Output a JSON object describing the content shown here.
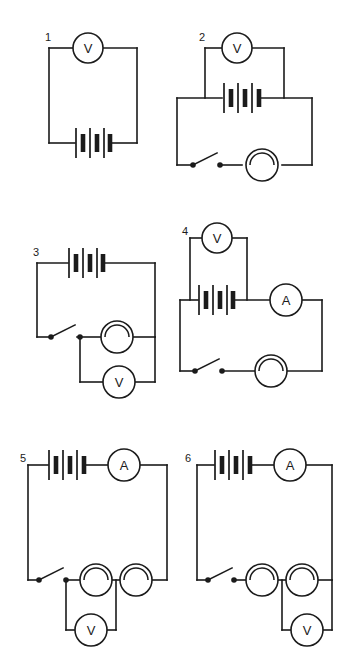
{
  "page": {
    "background_color": "#ffffff",
    "line_color": "#1b1b1b",
    "width": 344,
    "height": 654
  },
  "symbols": {
    "voltmeter_label": "V",
    "ammeter_label": "A",
    "battery_name": "battery-symbol",
    "lamp_name": "lamp-symbol",
    "switch_name": "switch-symbol"
  },
  "circuits": [
    {
      "number": "1",
      "components": [
        "voltmeter",
        "battery"
      ],
      "voltmeter_label": "V",
      "description": "Single loop: voltmeter on top branch, battery on bottom branch"
    },
    {
      "number": "2",
      "components": [
        "voltmeter",
        "battery",
        "switch",
        "lamp"
      ],
      "voltmeter_label": "V",
      "description": "Voltmeter connected across the battery; main loop contains switch and lamp"
    },
    {
      "number": "3",
      "components": [
        "battery",
        "switch",
        "lamp",
        "voltmeter"
      ],
      "voltmeter_label": "V",
      "description": "Battery on top, switch on bottom left, lamp in series, voltmeter across lamp"
    },
    {
      "number": "4",
      "components": [
        "voltmeter",
        "battery",
        "ammeter",
        "switch",
        "lamp"
      ],
      "voltmeter_label": "V",
      "ammeter_label": "A",
      "description": "Voltmeter across battery, ammeter in series, switch and lamp on bottom branch"
    },
    {
      "number": "5",
      "components": [
        "battery",
        "ammeter",
        "switch",
        "lamp",
        "lamp",
        "voltmeter"
      ],
      "voltmeter_label": "V",
      "ammeter_label": "A",
      "description": "Battery and ammeter on top, switch and two lamps in series, voltmeter across first lamp"
    },
    {
      "number": "6",
      "components": [
        "battery",
        "ammeter",
        "switch",
        "lamp",
        "lamp",
        "voltmeter"
      ],
      "voltmeter_label": "V",
      "ammeter_label": "A",
      "description": "Battery and ammeter on top, switch and two lamps in series, voltmeter across second lamp"
    }
  ]
}
